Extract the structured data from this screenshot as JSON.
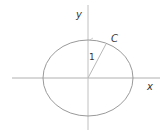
{
  "diagram": {
    "title": "",
    "axes": {
      "x_label": "x",
      "y_label": "y"
    },
    "curve_label": "C",
    "radius_label": "1",
    "colors": {
      "axes": "#aaaaaa",
      "curve": "#9a9a9a",
      "text": "#333333"
    }
  }
}
